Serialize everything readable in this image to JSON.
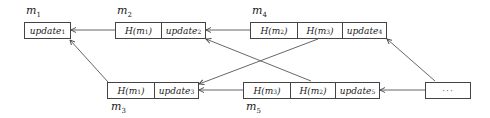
{
  "diagram": {
    "type": "linked-message-graph",
    "nodes": [
      {
        "id": "m1",
        "label": "m",
        "label_sub": "1",
        "label_pos": "above",
        "cells": [
          {
            "text": "update",
            "sub": "1"
          }
        ]
      },
      {
        "id": "m2",
        "label": "m",
        "label_sub": "2",
        "label_pos": "above",
        "cells": [
          {
            "text": "H(m",
            "sub": "1",
            "after": ")"
          },
          {
            "text": "update",
            "sub": "2"
          }
        ]
      },
      {
        "id": "m4",
        "label": "m",
        "label_sub": "4",
        "label_pos": "above",
        "cells": [
          {
            "text": "H(m",
            "sub": "2",
            "after": ")"
          },
          {
            "text": "H(m",
            "sub": "3",
            "after": ")"
          },
          {
            "text": "update",
            "sub": "4"
          }
        ]
      },
      {
        "id": "m3",
        "label": "m",
        "label_sub": "3",
        "label_pos": "below",
        "cells": [
          {
            "text": "H(m",
            "sub": "1",
            "after": ")"
          },
          {
            "text": "update",
            "sub": "3"
          }
        ]
      },
      {
        "id": "m5",
        "label": "m",
        "label_sub": "5",
        "label_pos": "below",
        "cells": [
          {
            "text": "H(m",
            "sub": "3",
            "after": ")"
          },
          {
            "text": "H(m",
            "sub": "2",
            "after": ")"
          },
          {
            "text": "update",
            "sub": "5"
          }
        ]
      },
      {
        "id": "more",
        "label": "",
        "label_sub": "",
        "label_pos": "none",
        "cells": [
          {
            "text": "···",
            "sub": ""
          }
        ]
      }
    ],
    "edges": [
      {
        "from": "m2.H(m1)",
        "to": "m1"
      },
      {
        "from": "m4.H(m2)",
        "to": "m2"
      },
      {
        "from": "m3.H(m1)",
        "to": "m1"
      },
      {
        "from": "m4.H(m3)",
        "to": "m3"
      },
      {
        "from": "m5.H(m3)",
        "to": "m3"
      },
      {
        "from": "m5.H(m2)",
        "to": "m2"
      },
      {
        "from": "more",
        "to": "m4"
      },
      {
        "from": "more",
        "to": "m5"
      }
    ]
  }
}
